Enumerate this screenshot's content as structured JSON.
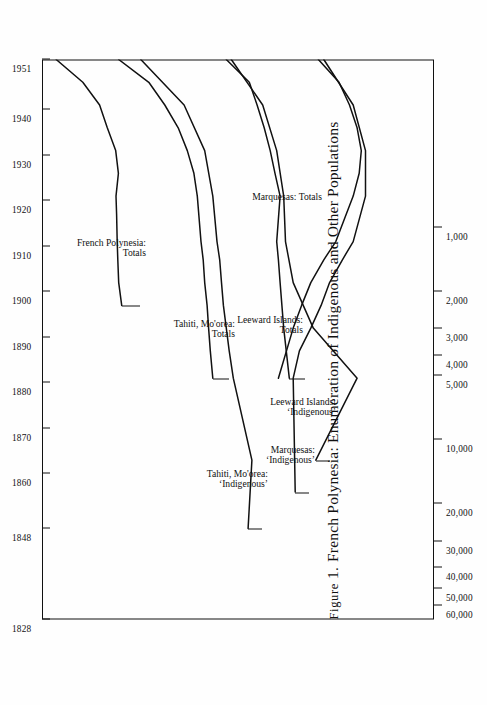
{
  "figure": {
    "label_smallcaps": "Figure",
    "number": "1.",
    "title": "French Polynesia: Enumeration of Indigenous and Other Populations",
    "full_title": "Figure 1. French Polynesia: Enumeration of Indigenous and Other Populations"
  },
  "chart_data": {
    "type": "line",
    "orientation": "rotated-90-ccw",
    "xlabel": "",
    "ylabel": "",
    "grid": false,
    "legend": "inline-labels",
    "yscale": "log",
    "ylim": [
      1000,
      70000
    ],
    "x": [
      1828,
      1848,
      1860,
      1870,
      1880,
      1890,
      1900,
      1910,
      1920,
      1930,
      1940,
      1951
    ],
    "xtick_labels": [
      "1828",
      "1848",
      "1860",
      "1870",
      "1880",
      "1890",
      "1900",
      "1910",
      "1920",
      "1930",
      "1940",
      "1951"
    ],
    "ytick_labels": [
      "60,000",
      "50,000",
      "40,000",
      "30,000",
      "20,000",
      "10,000",
      "5,000",
      "4,000",
      "3,000",
      "2,000",
      "1,000"
    ],
    "ytick_values": [
      60000,
      50000,
      40000,
      30000,
      20000,
      10000,
      5000,
      4000,
      3000,
      2000,
      1000
    ],
    "series": [
      {
        "name": "French Polynesia: Totals",
        "label_lines": [
          "French Polynesia:",
          "Totals"
        ],
        "x": [
          1897,
          1902,
          1907,
          1911,
          1917,
          1921,
          1926,
          1931,
          1936,
          1941,
          1946,
          1951
        ],
        "values": [
          29500,
          30500,
          30800,
          31000,
          31200,
          31400,
          30600,
          31500,
          34500,
          37500,
          45000,
          60000
        ]
      },
      {
        "name": "Tahiti, Mo'orea: Totals",
        "label_lines": [
          "Tahiti, Mo'orea:",
          "Totals"
        ],
        "x": [
          1881,
          1887,
          1892,
          1897,
          1902,
          1907,
          1911,
          1921,
          1926,
          1931,
          1936,
          1941,
          1946,
          1951
        ],
        "values": [
          11000,
          11300,
          11500,
          11700,
          12000,
          12200,
          12500,
          13000,
          13500,
          14500,
          16000,
          18500,
          22000,
          30500
        ]
      },
      {
        "name": "Tahiti, Mo'orea: 'Indigenous'",
        "label_lines": [
          "Tahiti, Mo'orea:",
          "‘Indigenous’"
        ],
        "x": [
          1848,
          1863,
          1881,
          1887,
          1892,
          1897,
          1902,
          1907,
          1911,
          1921,
          1931,
          1941,
          1951
        ],
        "values": [
          7500,
          7200,
          8800,
          9200,
          9500,
          9800,
          10000,
          10200,
          10500,
          11000,
          12000,
          15000,
          24000
        ]
      },
      {
        "name": "Leeward Islands: Totals",
        "label_lines": [
          "Leeward Islands:",
          "Totals"
        ],
        "x": [
          1881,
          1892,
          1897,
          1902,
          1907,
          1911,
          1921,
          1926,
          1931,
          1936,
          1941,
          1946,
          1951
        ],
        "values": [
          4800,
          5100,
          5200,
          5300,
          5400,
          5500,
          5300,
          5600,
          5900,
          6300,
          6800,
          7400,
          9500
        ]
      },
      {
        "name": "Leeward Islands: 'Indigenous'",
        "label_lines": [
          "Leeward Islands:",
          "‘Indigenous’"
        ],
        "x": [
          1863,
          1881,
          1892,
          1902,
          1911,
          1921,
          1931,
          1941,
          1951
        ],
        "values": [
          3600,
          2300,
          3700,
          4600,
          5000,
          5100,
          5500,
          6400,
          9000
        ]
      },
      {
        "name": "Marquesas: 'Indigenous'",
        "label_lines": [
          "Marquesas:",
          "‘Indigenous’"
        ],
        "x": [
          1856,
          1881,
          1887,
          1892,
          1897,
          1902,
          1907,
          1911,
          1921,
          1931,
          1941,
          1951
        ],
        "values": [
          4500,
          4600,
          4300,
          3800,
          3400,
          3100,
          2700,
          2400,
          2100,
          2100,
          2400,
          3300
        ]
      },
      {
        "name": "Marquesas: Totals",
        "label_lines": [
          "Marquesas: Totals"
        ],
        "x": [
          1881,
          1892,
          1897,
          1902,
          1907,
          1911,
          1921,
          1926,
          1931,
          1936,
          1941,
          1946,
          1951
        ],
        "values": [
          5400,
          4600,
          4200,
          3800,
          3300,
          2900,
          2400,
          2250,
          2200,
          2300,
          2500,
          2800,
          3500
        ]
      }
    ]
  }
}
